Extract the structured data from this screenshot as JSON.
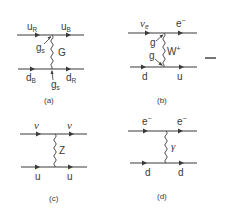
{
  "figure": {
    "separator": "−",
    "panels": [
      {
        "caption": "(a)",
        "top": {
          "in_label": "u",
          "in_sub": "R",
          "out_label": "u",
          "out_sub": "B"
        },
        "bottom": {
          "in_label": "d",
          "in_sub": "B",
          "out_label": "d",
          "out_sub": "R"
        },
        "boson": {
          "label": "G"
        },
        "couplings": [
          {
            "label": "g",
            "sub": "s"
          },
          {
            "label": "g",
            "sub": "s"
          }
        ]
      },
      {
        "caption": "(b)",
        "top": {
          "in_label": "ν",
          "in_sub": "e",
          "out_label": "e",
          "out_sup": "−"
        },
        "bottom": {
          "in_label": "d",
          "out_label": "u"
        },
        "boson": {
          "label": "W",
          "sup": "+"
        },
        "couplings": [
          {
            "label": "g"
          },
          {
            "label": "g"
          }
        ]
      },
      {
        "caption": "(c)",
        "top": {
          "in_label": "ν",
          "out_label": "ν"
        },
        "bottom": {
          "in_label": "u",
          "out_label": "u"
        },
        "boson": {
          "label": "Z"
        }
      },
      {
        "caption": "(d)",
        "top": {
          "in_label": "e",
          "in_sup": "−",
          "out_label": "e",
          "out_sup": "−"
        },
        "bottom": {
          "in_label": "d",
          "out_label": "d"
        },
        "boson": {
          "label": "γ"
        }
      }
    ]
  }
}
